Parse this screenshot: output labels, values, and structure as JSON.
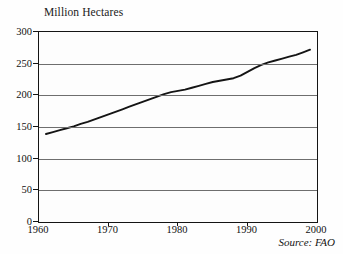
{
  "chart_data": {
    "type": "line",
    "title": "Million Hectares",
    "xlabel": "",
    "ylabel": "",
    "xlim": [
      1960,
      2000
    ],
    "ylim": [
      0,
      300
    ],
    "grid": true,
    "legend": null,
    "annotation": "Source: FAO",
    "xticks": [
      1960,
      1970,
      1980,
      1990,
      2000
    ],
    "xtick_labels": [
      "1960",
      "1970",
      "1980",
      "1990",
      "2000"
    ],
    "yticks": [
      0,
      50,
      100,
      150,
      200,
      250,
      300
    ],
    "ytick_labels": [
      "0",
      "50",
      "100",
      "150",
      "200",
      "250",
      "300"
    ],
    "line_color": "#141414",
    "series": [
      {
        "name": "Irrigated Area",
        "x": [
          1961,
          1962,
          1963,
          1964,
          1965,
          1966,
          1967,
          1968,
          1969,
          1970,
          1971,
          1972,
          1973,
          1974,
          1975,
          1976,
          1977,
          1978,
          1979,
          1980,
          1981,
          1982,
          1983,
          1984,
          1985,
          1986,
          1987,
          1988,
          1989,
          1990,
          1991,
          1992,
          1993,
          1994,
          1995,
          1996,
          1997,
          1998,
          1999
        ],
        "values": [
          139,
          142,
          145,
          148,
          151,
          155,
          158,
          162,
          166,
          170,
          174,
          178,
          182,
          186,
          190,
          194,
          198,
          202,
          205,
          207,
          209,
          212,
          215,
          218,
          221,
          223,
          225,
          227,
          231,
          237,
          243,
          248,
          252,
          255,
          258,
          261,
          264,
          268,
          272
        ]
      }
    ]
  }
}
